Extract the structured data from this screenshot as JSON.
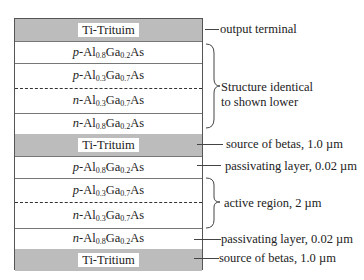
{
  "diagram": {
    "layers": [
      {
        "id": "top-metal",
        "type": "metal",
        "label": "Ti-Trituim"
      },
      {
        "id": "p-high",
        "type": "semi",
        "prefix": "p",
        "label": "-Al",
        "x1": "0.8",
        "mid": "Ga",
        "x2": "0.2",
        "suffix": "As"
      },
      {
        "id": "p-low",
        "type": "semi",
        "prefix": "p",
        "label": "-Al",
        "x1": "0.3",
        "mid": "Ga",
        "x2": "0.7",
        "suffix": "As"
      },
      {
        "id": "n-low",
        "type": "semi",
        "prefix": "n",
        "label": "-Al",
        "x1": "0.3",
        "mid": "Ga",
        "x2": "0.7",
        "suffix": "As"
      },
      {
        "id": "n-high",
        "type": "semi",
        "prefix": "n",
        "label": "-Al",
        "x1": "0.8",
        "mid": "Ga",
        "x2": "0.2",
        "suffix": "As"
      },
      {
        "id": "mid-metal",
        "type": "metal",
        "label": "Ti-Trituim"
      },
      {
        "id": "p-high-2",
        "type": "semi",
        "prefix": "p",
        "label": "-Al",
        "x1": "0.8",
        "mid": "Ga",
        "x2": "0.2",
        "suffix": "As"
      },
      {
        "id": "p-low-2",
        "type": "semi",
        "prefix": "p",
        "label": "-Al",
        "x1": "0.3",
        "mid": "Ga",
        "x2": "0.7",
        "suffix": "As"
      },
      {
        "id": "n-low-2",
        "type": "semi",
        "prefix": "n",
        "label": "-Al",
        "x1": "0.3",
        "mid": "Ga",
        "x2": "0.7",
        "suffix": "As"
      },
      {
        "id": "n-high-2",
        "type": "semi",
        "prefix": "n",
        "label": "-Al",
        "x1": "0.8",
        "mid": "Ga",
        "x2": "0.2",
        "suffix": "As"
      },
      {
        "id": "bottom-metal",
        "type": "metal",
        "label": "Ti-Tritium"
      }
    ],
    "annotations": {
      "output_terminal": "output terminal",
      "structure_identical_1": "Structure identical",
      "structure_identical_2": "to shown lower",
      "source_betas_mid": "source of betas, 1.0 µm",
      "passivating_upper": "passivating layer, 0.02 µm",
      "active_region": "active region, 2 µm",
      "passivating_lower": "passivating layer, 0.02 µm",
      "source_betas_bottom": "source of betas, 1.0 µm"
    },
    "colors": {
      "metal_fill": "#bcbcbc",
      "border": "#555555"
    }
  }
}
